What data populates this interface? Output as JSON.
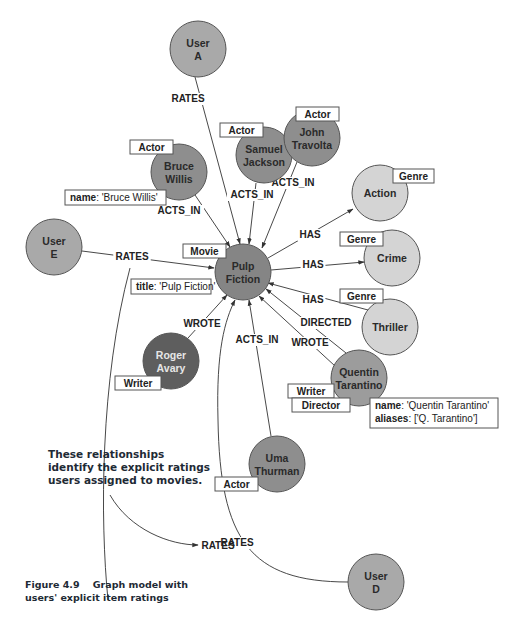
{
  "colors": {
    "user_fill": "#a9a9a9",
    "actor_fill": "#8e8e8e",
    "movie_fill": "#858585",
    "genre_fill": "#d4d4d4",
    "writer_fill": "#5e5e5e",
    "director_fill": "#9c9c9c",
    "stroke": "#555555"
  },
  "nodes": [
    {
      "id": "userA",
      "line1": "User",
      "line2": "A",
      "cx": 198,
      "cy": 49,
      "r": 28,
      "fill": "#a9a9a9",
      "light": false
    },
    {
      "id": "bruce",
      "line1": "Bruce",
      "line2": "Willis",
      "cx": 179,
      "cy": 172,
      "r": 28,
      "fill": "#8e8e8e",
      "light": false
    },
    {
      "id": "samuel",
      "line1": "Samuel",
      "line2": "Jackson",
      "cx": 264,
      "cy": 155,
      "r": 28,
      "fill": "#8e8e8e",
      "light": false
    },
    {
      "id": "john",
      "line1": "John",
      "line2": "Travolta",
      "cx": 312,
      "cy": 138,
      "r": 28,
      "fill": "#8e8e8e",
      "light": false
    },
    {
      "id": "userE",
      "line1": "User",
      "line2": "E",
      "cx": 54,
      "cy": 247,
      "r": 28,
      "fill": "#a9a9a9",
      "light": false
    },
    {
      "id": "pulp",
      "line1": "Pulp",
      "line2": "Fiction",
      "cx": 243,
      "cy": 272,
      "r": 28,
      "fill": "#858585",
      "light": false
    },
    {
      "id": "action",
      "line1": "Action",
      "line2": "",
      "cx": 380,
      "cy": 193,
      "r": 28,
      "fill": "#d4d4d4",
      "light": false
    },
    {
      "id": "crime",
      "line1": "Crime",
      "line2": "",
      "cx": 392,
      "cy": 258,
      "r": 28,
      "fill": "#d4d4d4",
      "light": false
    },
    {
      "id": "thriller",
      "line1": "Thriller",
      "line2": "",
      "cx": 390,
      "cy": 327,
      "r": 28,
      "fill": "#d4d4d4",
      "light": false
    },
    {
      "id": "roger",
      "line1": "Roger",
      "line2": "Avary",
      "cx": 171,
      "cy": 361,
      "r": 28,
      "fill": "#5e5e5e",
      "light": true
    },
    {
      "id": "quentin",
      "line1": "Quentin",
      "line2": "Tarantino",
      "cx": 359,
      "cy": 378,
      "r": 28,
      "fill": "#9c9c9c",
      "light": false
    },
    {
      "id": "uma",
      "line1": "Uma",
      "line2": "Thurman",
      "cx": 277,
      "cy": 464,
      "r": 28,
      "fill": "#8e8e8e",
      "light": false
    },
    {
      "id": "userD",
      "line1": "User",
      "line2": "D",
      "cx": 376,
      "cy": 582,
      "r": 28,
      "fill": "#a9a9a9",
      "light": false
    }
  ],
  "edges": [
    {
      "label": "RATES",
      "d": "M195,77 L240,244",
      "lx": 188,
      "ly": 102
    },
    {
      "label": "ACTS_IN",
      "d": "M195,195 L230,247",
      "lx": 179,
      "ly": 214
    },
    {
      "label": "ACTS_IN",
      "d": "M256,183 L249,244",
      "lx": 252,
      "ly": 198
    },
    {
      "label": "ACTS_IN",
      "d": "M297,162 L262,248",
      "lx": 293,
      "ly": 186
    },
    {
      "label": "RATES",
      "d": "M82,251 L214,268",
      "lx": 132,
      "ly": 260
    },
    {
      "label": "HAS",
      "d": "M268,258 L353,209",
      "lx": 310,
      "ly": 238
    },
    {
      "label": "HAS",
      "d": "M271,270 L364,262",
      "lx": 313,
      "ly": 268
    },
    {
      "label": "HAS",
      "d": "M368,310 L268,283",
      "lx": 313,
      "ly": 303
    },
    {
      "label": "DIRECTED",
      "d": "M346,353 L266,289",
      "lx": 326,
      "ly": 326
    },
    {
      "label": "WROTE",
      "d": "M335,366 L259,296",
      "lx": 310,
      "ly": 346
    },
    {
      "label": "WROTE",
      "d": "M188,338 L227,295",
      "lx": 202,
      "ly": 327
    },
    {
      "label": "ACTS_IN",
      "d": "M271,436 L249,300",
      "lx": 257,
      "ly": 343
    },
    {
      "label": "RATES",
      "d": "M348,582 C250,582 220,540 218,420 C216,350 225,320 235,300",
      "lx": 237,
      "ly": 546
    },
    {
      "label": "",
      "d": "M108,600 C100,520 100,380 130,268",
      "lx": 0,
      "ly": 0
    }
  ],
  "tags": [
    {
      "text": "Actor",
      "x": 130,
      "y": 140,
      "w": 43,
      "h": 14
    },
    {
      "text": "Actor",
      "x": 220,
      "y": 123,
      "w": 43,
      "h": 14
    },
    {
      "text": "Actor",
      "x": 296,
      "y": 107,
      "w": 43,
      "h": 14
    },
    {
      "text": "Genre",
      "x": 393,
      "y": 169,
      "w": 41,
      "h": 14
    },
    {
      "text": "Genre",
      "x": 340,
      "y": 232,
      "w": 43,
      "h": 14
    },
    {
      "text": "Genre",
      "x": 340,
      "y": 289,
      "w": 43,
      "h": 14
    },
    {
      "text": "Movie",
      "x": 183,
      "y": 244,
      "w": 43,
      "h": 14
    },
    {
      "text": "Writer",
      "x": 115,
      "y": 376,
      "w": 46,
      "h": 14
    },
    {
      "text": "Writer",
      "x": 288,
      "y": 384,
      "w": 46,
      "h": 14
    },
    {
      "text": "Director",
      "x": 292,
      "y": 398,
      "w": 58,
      "h": 14
    },
    {
      "text": "Actor",
      "x": 215,
      "y": 477,
      "w": 43,
      "h": 14
    }
  ],
  "props": [
    {
      "x": 65,
      "y": 190,
      "w": 101,
      "h": 15,
      "lines": [
        {
          "key": "name",
          "val": ": 'Bruce Willis'"
        }
      ]
    },
    {
      "x": 131,
      "y": 279,
      "w": 80,
      "h": 15,
      "lines": [
        {
          "key": "title",
          "val": ": 'Pulp Fiction'"
        }
      ]
    },
    {
      "x": 370,
      "y": 398,
      "w": 128,
      "h": 30,
      "lines": [
        {
          "key": "name",
          "val": ": 'Quentin Tarantino'"
        },
        {
          "key": "aliases",
          "val": ": ['Q. Tarantino']"
        }
      ]
    }
  ],
  "annotation": {
    "lines": [
      "These relationships",
      "identify the explicit ratings",
      "users assigned to movies."
    ],
    "pointer_label": "RATES"
  },
  "caption": {
    "line1": "Figure 4.9    Graph model with",
    "line2": "users' explicit item ratings"
  }
}
